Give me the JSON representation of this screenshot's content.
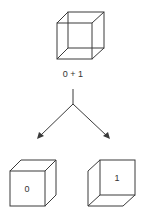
{
  "diagram": {
    "top_cube": {
      "label": "0 + 1",
      "type": "necker-cube-ambiguous"
    },
    "split": {
      "branches": 2
    },
    "left_cube": {
      "label": "0",
      "type": "cube-viewed-from-above"
    },
    "right_cube": {
      "label": "1",
      "type": "cube-viewed-from-below"
    },
    "colors": {
      "stroke": "#3a3a3a",
      "text": "#333333",
      "background": "#ffffff"
    }
  }
}
